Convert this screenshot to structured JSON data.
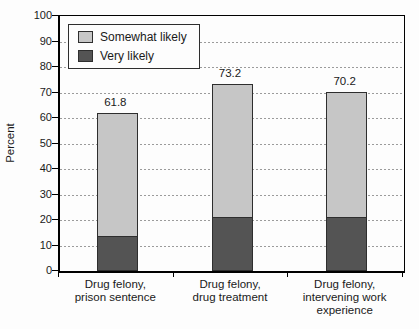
{
  "chart_data": {
    "type": "bar",
    "stacked": true,
    "title": "",
    "xlabel": "",
    "ylabel": "Percent",
    "ylim": [
      0,
      100
    ],
    "yticks": [
      0,
      10,
      20,
      30,
      40,
      50,
      60,
      70,
      80,
      90,
      100
    ],
    "grid": "horizontal-dashed",
    "legend_position": "top-left-inside",
    "categories": [
      "Drug felony,\nprison sentence",
      "Drug felony,\ndrug treatment",
      "Drug felony,\nintervening work\nexperience"
    ],
    "series": [
      {
        "name": "Very likely",
        "color": "#545454",
        "values": [
          14.0,
          21.5,
          21.5
        ]
      },
      {
        "name": "Somewhat likely",
        "color": "#c6c6c6",
        "values": [
          47.8,
          51.7,
          48.7
        ]
      }
    ],
    "totals": [
      61.8,
      73.2,
      70.2
    ],
    "total_labels": [
      "61.8",
      "73.2",
      "70.2"
    ],
    "legend": [
      {
        "label": "Somewhat likely",
        "color": "#c6c6c6"
      },
      {
        "label": "Very likely",
        "color": "#545454"
      }
    ],
    "colors": {
      "grid": "#9b9b9b",
      "axis": "#000000",
      "bar_border": "#2e2e2e",
      "text": "#1a1a1a",
      "background": "#fdfdfd"
    }
  }
}
